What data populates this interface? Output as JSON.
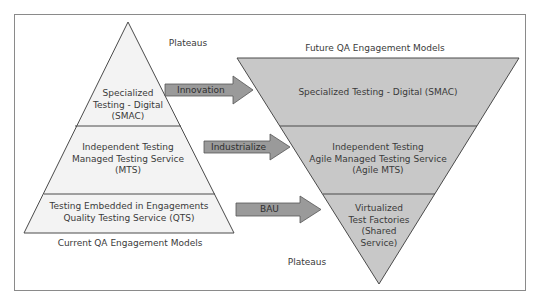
{
  "diagram": {
    "colors": {
      "frame": "#8a8a8a",
      "line": "#4a4a4a",
      "left_fill": "#f3f3f3",
      "right_fill": "#c8c8c8",
      "arrow_fill": "#9a9a9a",
      "text": "#3a3a3a"
    },
    "left_pyramid": {
      "top_label": "Plateaus",
      "bottom_label": "Current QA Engagement Models",
      "tiers": [
        {
          "lines": [
            "Specialized",
            "Testing - Digital",
            "(SMAC)"
          ]
        },
        {
          "lines": [
            "Independent Testing",
            "Managed Testing Service",
            "(MTS)"
          ]
        },
        {
          "lines": [
            "Testing Embedded in Engagements",
            "Quality Testing Service (QTS)"
          ]
        }
      ]
    },
    "right_pyramid": {
      "top_label": "Future QA Engagement Models",
      "bottom_label": "Plateaus",
      "tiers": [
        {
          "lines": [
            "Specialized Testing - Digital (SMAC)"
          ]
        },
        {
          "lines": [
            "Independent Testing",
            "Agile Managed Testing Service",
            "(Agile MTS)"
          ]
        },
        {
          "lines": [
            "Virtualized",
            "Test Factories",
            "(Shared",
            "Service)"
          ]
        }
      ]
    },
    "arrows": [
      {
        "label": "Innovation"
      },
      {
        "label": "Industrialize"
      },
      {
        "label": "BAU"
      }
    ]
  }
}
